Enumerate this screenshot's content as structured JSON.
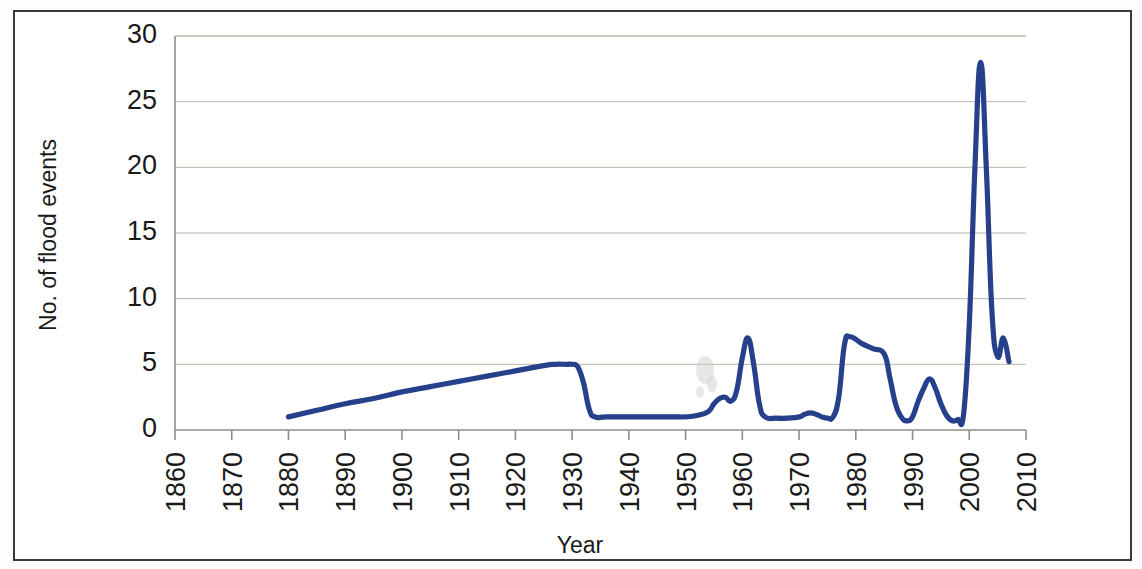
{
  "figure": {
    "name": "flood-events-timeseries",
    "background_color": "#ffffff",
    "frame_color": "#3a3a3a"
  },
  "chart_data": {
    "type": "line",
    "title": "",
    "xlabel": "Year",
    "ylabel": "No. of flood events",
    "xlim": [
      1860,
      2010
    ],
    "ylim": [
      0,
      30
    ],
    "grid": true,
    "legend": false,
    "line_color": "#27408B",
    "gridline_color": "#b8b5ab",
    "x_tick_labels": [
      "1860",
      "1870",
      "1880",
      "1890",
      "1900",
      "1910",
      "1920",
      "1930",
      "1940",
      "1950",
      "1960",
      "1970",
      "1980",
      "1990",
      "2000",
      "2010"
    ],
    "x_ticks": [
      1860,
      1870,
      1880,
      1890,
      1900,
      1910,
      1920,
      1930,
      1940,
      1950,
      1960,
      1970,
      1980,
      1990,
      2000,
      2010
    ],
    "y_tick_labels": [
      "0",
      "5",
      "10",
      "15",
      "20",
      "25",
      "30"
    ],
    "y_ticks": [
      0,
      5,
      10,
      15,
      20,
      25,
      30
    ],
    "series": [
      {
        "name": "No. of flood events",
        "x": [
          1880,
          1885,
          1890,
          1895,
          1900,
          1905,
          1910,
          1915,
          1920,
          1925,
          1927,
          1929,
          1930,
          1931,
          1932,
          1933,
          1934,
          1936,
          1940,
          1944,
          1948,
          1950,
          1952,
          1954,
          1955,
          1956,
          1957,
          1958,
          1959,
          1960,
          1961,
          1962,
          1963,
          1964,
          1966,
          1968,
          1970,
          1971,
          1972,
          1973,
          1974,
          1975,
          1976,
          1977,
          1978,
          1979,
          1981,
          1983,
          1985,
          1986,
          1987,
          1988,
          1989,
          1990,
          1991,
          1992,
          1993,
          1994,
          1995,
          1996,
          1997,
          1998,
          1999,
          2000,
          2001,
          2002,
          2003,
          2004,
          2005,
          2006,
          2007
        ],
        "y": [
          1.0,
          1.5,
          2.0,
          2.4,
          2.9,
          3.3,
          3.7,
          4.1,
          4.5,
          4.9,
          5.0,
          5.0,
          5.0,
          4.8,
          3.6,
          1.6,
          1.0,
          1.0,
          1.0,
          1.0,
          1.0,
          1.0,
          1.1,
          1.4,
          2.0,
          2.4,
          2.5,
          2.2,
          3.0,
          5.5,
          7.0,
          5.0,
          2.0,
          1.0,
          0.9,
          0.9,
          1.0,
          1.2,
          1.3,
          1.2,
          1.0,
          0.9,
          1.0,
          2.5,
          6.5,
          7.1,
          6.6,
          6.2,
          5.8,
          4.0,
          2.0,
          1.0,
          0.7,
          1.0,
          2.2,
          3.2,
          3.9,
          3.2,
          2.0,
          1.1,
          0.7,
          0.8,
          1.2,
          8.0,
          20.0,
          28.0,
          20.0,
          9.0,
          5.6,
          7.0,
          5.2
        ],
        "peak": {
          "year": 2002,
          "value": 28
        },
        "final_value": 6.8
      }
    ],
    "annotations": []
  }
}
